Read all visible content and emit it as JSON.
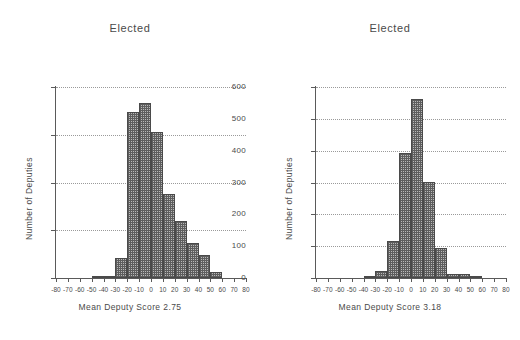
{
  "figure": {
    "background": "#ffffff",
    "ink_color": "#4a4a4a",
    "bar_fill": "#b9b9b9",
    "bar_edge": "#4a4a4a",
    "grid_color": "#9a9a9a"
  },
  "chart_data": [
    {
      "type": "bar",
      "id": "left-histogram",
      "title": "Elected",
      "xlabel": "Mean Deputy Score 2.75",
      "ylabel": "Number of Deputies",
      "xlim": [
        -80,
        80
      ],
      "ylim": [
        0,
        400
      ],
      "grid": true,
      "legend": "none",
      "bin_width": 10,
      "xticks": [
        -80,
        -70,
        -60,
        -50,
        -40,
        -30,
        -20,
        -10,
        0,
        10,
        20,
        30,
        40,
        50,
        60,
        70,
        80
      ],
      "xtick_labels": [
        "-80",
        "-70",
        "-60",
        "-50",
        "-40",
        "-30",
        "-20",
        "-10",
        "0",
        "10",
        "20",
        "30",
        "40",
        "50",
        "60",
        "70",
        "80"
      ],
      "yticks": [
        0,
        100,
        200,
        300,
        400
      ],
      "ytick_labels": [
        "0",
        "100",
        "200",
        "300",
        "400"
      ],
      "bins": [
        {
          "start": -50,
          "end": -40,
          "value": 2
        },
        {
          "start": -40,
          "end": -30,
          "value": 5
        },
        {
          "start": -30,
          "end": -20,
          "value": 42
        },
        {
          "start": -20,
          "end": -10,
          "value": 348
        },
        {
          "start": -10,
          "end": 0,
          "value": 366
        },
        {
          "start": 0,
          "end": 10,
          "value": 306
        },
        {
          "start": 10,
          "end": 20,
          "value": 176
        },
        {
          "start": 20,
          "end": 30,
          "value": 120
        },
        {
          "start": 30,
          "end": 40,
          "value": 74
        },
        {
          "start": 40,
          "end": 50,
          "value": 49
        },
        {
          "start": 50,
          "end": 60,
          "value": 12
        }
      ]
    },
    {
      "type": "bar",
      "id": "right-histogram",
      "title": "Elected",
      "xlabel": "Mean Deputy Score 3.18",
      "ylabel": "Number of Deputies",
      "xlim": [
        -80,
        80
      ],
      "ylim": [
        0,
        600
      ],
      "grid": true,
      "legend": "none",
      "bin_width": 10,
      "xticks": [
        -80,
        -70,
        -60,
        -50,
        -40,
        -30,
        -20,
        -10,
        0,
        10,
        20,
        30,
        40,
        50,
        60,
        70,
        80
      ],
      "xtick_labels": [
        "-80",
        "-70",
        "-60",
        "-50",
        "-40",
        "-30",
        "-20",
        "-10",
        "0",
        "10",
        "20",
        "30",
        "40",
        "50",
        "60",
        "70",
        "80"
      ],
      "yticks": [
        0,
        100,
        200,
        300,
        400,
        500,
        600
      ],
      "ytick_labels": [
        "0",
        "100",
        "200",
        "300",
        "400",
        "500",
        "600"
      ],
      "bins": [
        {
          "start": -40,
          "end": -30,
          "value": 4
        },
        {
          "start": -30,
          "end": -20,
          "value": 22
        },
        {
          "start": -20,
          "end": -10,
          "value": 116
        },
        {
          "start": -10,
          "end": 0,
          "value": 392
        },
        {
          "start": 0,
          "end": 10,
          "value": 562
        },
        {
          "start": 10,
          "end": 20,
          "value": 302
        },
        {
          "start": 20,
          "end": 30,
          "value": 93
        },
        {
          "start": 30,
          "end": 40,
          "value": 14
        },
        {
          "start": 40,
          "end": 50,
          "value": 14
        },
        {
          "start": 50,
          "end": 60,
          "value": 5
        }
      ]
    }
  ]
}
